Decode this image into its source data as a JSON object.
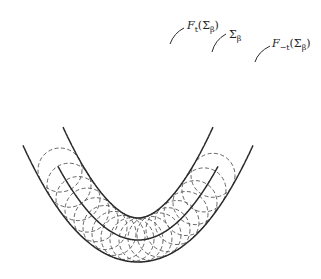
{
  "diagram": {
    "labels": {
      "ft": "F",
      "ft_sub": "t",
      "ft_arg": "(Σ",
      "ft_arg_sub": "β",
      "ft_close": ")",
      "sigma": "Σ",
      "sigma_sub": "β",
      "fmt": "F",
      "fmt_sub": "−t",
      "fmt_arg": "(Σ",
      "fmt_arg_sub": "β",
      "fmt_close": ")"
    },
    "colors": {
      "solid": "#2a2a2a",
      "dashed": "#555555",
      "background": "#ffffff"
    },
    "curves": [
      "F_t(Σβ) outer parallel curve",
      "Σβ base parabola",
      "F_-t(Σβ) inner parallel curve with swallowtail",
      "family of dashed circles of radius t centered on Σβ"
    ]
  }
}
